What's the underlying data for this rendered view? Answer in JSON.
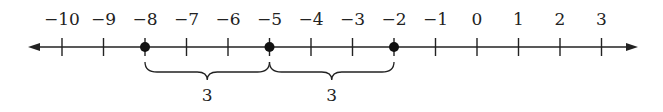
{
  "diagram": {
    "type": "number-line",
    "min": -10,
    "max": 3,
    "tick_labels": [
      "−10",
      "−9",
      "−8",
      "−7",
      "−6",
      "−5",
      "−4",
      "−3",
      "−2",
      "−1",
      "0",
      "1",
      "2",
      "3"
    ],
    "points": [
      -8,
      -5,
      -2
    ],
    "braces": [
      {
        "from": -8,
        "to": -5,
        "label": "3"
      },
      {
        "from": -5,
        "to": -2,
        "label": "3"
      }
    ],
    "colors": {
      "line": "#222222",
      "point": "#111111"
    }
  }
}
